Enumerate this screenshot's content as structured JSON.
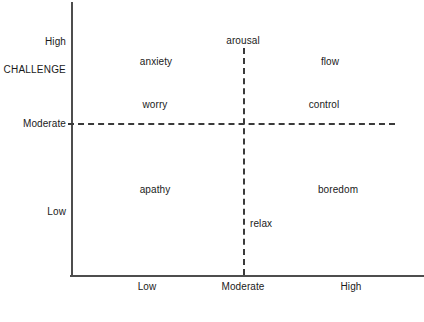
{
  "diagram": {
    "type": "quadrant-model",
    "background_color": "#ffffff",
    "line_color": "#4d4d4d",
    "dash_color": "#3a3a3a",
    "text_color": "#1a1a1a",
    "y_axis": {
      "name": "CHALLENGE",
      "ticks": [
        {
          "label": "High",
          "y": 42
        },
        {
          "label": "Moderate",
          "y": 124
        },
        {
          "label": "Low",
          "y": 212
        }
      ]
    },
    "x_axis": {
      "name": "",
      "ticks": [
        {
          "label": "Low",
          "x": 147
        },
        {
          "label": "Moderate",
          "x": 243
        },
        {
          "label": "High",
          "x": 351
        }
      ]
    },
    "quadrant_labels": [
      {
        "key": "anxiety",
        "text": "anxiety",
        "x": 156,
        "y": 62
      },
      {
        "key": "flow",
        "text": "flow",
        "x": 330,
        "y": 62
      },
      {
        "key": "worry",
        "text": "worry",
        "x": 155,
        "y": 105
      },
      {
        "key": "control",
        "text": "control",
        "x": 324,
        "y": 105
      },
      {
        "key": "apathy",
        "text": "apathy",
        "x": 155,
        "y": 190
      },
      {
        "key": "boredom",
        "text": "boredom",
        "x": 338,
        "y": 190
      }
    ],
    "axis_endpoint_labels": [
      {
        "key": "arousal",
        "text": "arousal",
        "x": 243,
        "y": 41
      },
      {
        "key": "relax",
        "text": "relax",
        "x": 250,
        "y": 224
      }
    ]
  }
}
